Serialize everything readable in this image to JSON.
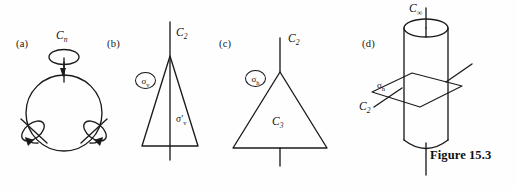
{
  "figure": {
    "caption": "Figure 15.3",
    "background_color": "#fefefe",
    "ink_color": "#1b1b1b"
  },
  "panels": [
    {
      "id": "a",
      "label": "(a)",
      "shape": "circle",
      "axes": [
        {
          "name": "principal-axis",
          "label": "C",
          "subscript": "n",
          "orientation": "vertical",
          "arrow": "curved-loop"
        },
        {
          "name": "secondary-axis-left",
          "label": "",
          "subscript": "",
          "orientation": "diagonal-left",
          "arrow": "curved-loop"
        },
        {
          "name": "secondary-axis-right",
          "label": "",
          "subscript": "",
          "orientation": "diagonal-right",
          "arrow": "curved-loop"
        }
      ],
      "labels": {
        "principal": "C",
        "principal_sub": "n"
      }
    },
    {
      "id": "b",
      "label": "(b)",
      "shape": "narrow-isoceles-triangle",
      "axes": [
        {
          "name": "principal-axis",
          "label": "C",
          "subscript": "2",
          "orientation": "vertical",
          "arrow": "none"
        }
      ],
      "mirror_planes": [
        {
          "name": "sigma-v",
          "symbol": "σ",
          "subscript": "v",
          "circled": true
        },
        {
          "name": "sigma-v-prime",
          "symbol": "σ′",
          "subscript": "v",
          "circled": false
        }
      ],
      "labels": {
        "principal": "C",
        "principal_sub": "2",
        "sigma_v": "σ",
        "sigma_v_sub": "v",
        "sigma_v_prime": "σ",
        "sigma_v_prime_sub": "v"
      }
    },
    {
      "id": "c",
      "label": "(c)",
      "shape": "equilateral-triangle",
      "axes": [
        {
          "name": "principal-axis",
          "label": "C",
          "subscript": "2",
          "orientation": "vertical",
          "arrow": "none"
        },
        {
          "name": "rotation-axis-c3",
          "label": "C",
          "subscript": "3",
          "orientation": "perpendicular",
          "arrow": "none"
        }
      ],
      "mirror_planes": [
        {
          "name": "sigma-h",
          "symbol": "σ",
          "subscript": "h",
          "circled": true
        }
      ],
      "labels": {
        "principal": "C",
        "principal_sub": "2",
        "interior": "C",
        "interior_sub": "3",
        "sigma_h": "σ",
        "sigma_h_sub": "h"
      }
    },
    {
      "id": "d",
      "label": "(d)",
      "shape": "cylinder",
      "axes": [
        {
          "name": "principal-axis",
          "label": "C",
          "subscript": "∞",
          "orientation": "vertical",
          "arrow": "none"
        },
        {
          "name": "secondary-axis",
          "label": "C",
          "subscript": "2",
          "orientation": "horizontal-diagonal",
          "arrow": "none"
        }
      ],
      "mirror_planes": [
        {
          "name": "sigma-h",
          "symbol": "σ",
          "subscript": "h",
          "circled": false
        }
      ],
      "labels": {
        "principal": "C",
        "principal_sub": "∞",
        "secondary": "C",
        "secondary_sub": "2",
        "sigma_h": "σ",
        "sigma_h_sub": "h"
      }
    }
  ]
}
